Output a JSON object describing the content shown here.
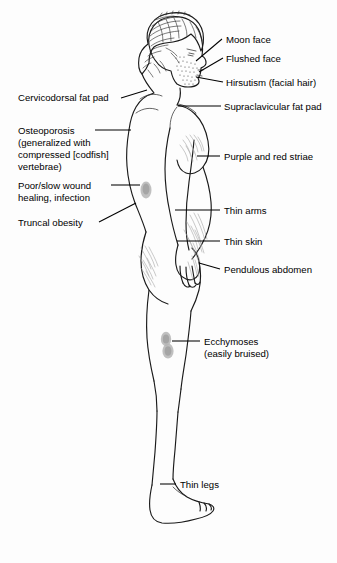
{
  "figure": {
    "background_color": "#fdfdfd",
    "line_color": "#1a1a1a",
    "striae_color": "#a8a8a8",
    "blotch_color": "#b5b5b5"
  },
  "labels": {
    "right": [
      {
        "id": "moon-face",
        "text": "Moon face"
      },
      {
        "id": "flushed-face",
        "text": "Flushed face"
      },
      {
        "id": "hirsutism",
        "text": "Hirsutism (facial hair)"
      },
      {
        "id": "supraclavicular-fat-pad",
        "text": "Supraclavicular fat pad"
      },
      {
        "id": "purple-and-red-striae",
        "text": "Purple and red striae"
      },
      {
        "id": "thin-arms",
        "text": "Thin arms"
      },
      {
        "id": "thin-skin",
        "text": "Thin skin"
      },
      {
        "id": "pendulous-abdomen",
        "text": "Pendulous abdomen"
      },
      {
        "id": "ecchymoses",
        "text_line1": "Ecchymoses",
        "text_line2": "(easily bruised)"
      },
      {
        "id": "thin-legs",
        "text": "Thin legs"
      }
    ],
    "left": [
      {
        "id": "cervicodorsal-fat-pad",
        "text": "Cervicodorsal fat pad"
      },
      {
        "id": "osteoporosis",
        "text_line1": "Osteoporosis",
        "text_line2": "(generalized with",
        "text_line3": "compressed [codfish]",
        "text_line4": "vertebrae)"
      },
      {
        "id": "poor-slow-wound-healing",
        "text_line1": "Poor/slow wound",
        "text_line2": "healing, infection"
      },
      {
        "id": "truncal-obesity",
        "text": "Truncal obesity"
      }
    ]
  }
}
